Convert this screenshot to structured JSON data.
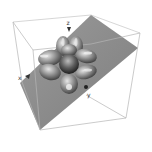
{
  "figure": {
    "lobe_count": 6,
    "axes": {
      "z_label": "z",
      "x_label": "x",
      "y_label": "y"
    },
    "colors": {
      "background": "#ffffff",
      "box_edge": "#b8b8b8",
      "plane_fill": "#8c8c8c",
      "surface_light": "#d6d6d6",
      "surface_mid": "#8a8a8a",
      "surface_dark": "#2e2e2e"
    }
  }
}
